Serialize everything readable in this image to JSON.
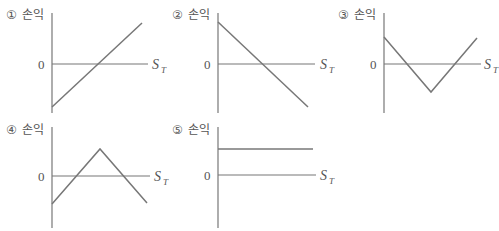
{
  "y_label": "손익",
  "zero_label": "0",
  "x_label_main": "S",
  "x_label_sub": "T",
  "panels": [
    {
      "number": "①",
      "label": "손익",
      "shape": "rising-line",
      "points": [
        [
          0,
          -1
        ],
        [
          1,
          1.2
        ]
      ]
    },
    {
      "number": "②",
      "label": "손익",
      "shape": "falling-line",
      "points": [
        [
          0,
          1.2
        ],
        [
          1,
          -1
        ]
      ]
    },
    {
      "number": "③",
      "label": "손익",
      "shape": "v-shape",
      "points": [
        [
          0,
          0.6
        ],
        [
          0.5,
          -0.6
        ],
        [
          1,
          0.6
        ]
      ]
    },
    {
      "number": "④",
      "label": "손익",
      "shape": "inverted-v",
      "points": [
        [
          0,
          -0.6
        ],
        [
          0.5,
          0.6
        ],
        [
          1,
          -0.6
        ]
      ]
    },
    {
      "number": "⑤",
      "label": "손익",
      "shape": "flat-line",
      "points": [
        [
          0,
          0.6
        ],
        [
          1,
          0.6
        ]
      ]
    }
  ]
}
